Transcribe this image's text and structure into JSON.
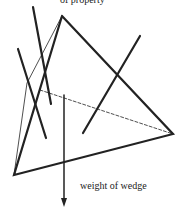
{
  "diagram": {
    "top_text_cut": "of property",
    "arrow_label": "weight of wedge",
    "line_color": "#222222"
  }
}
